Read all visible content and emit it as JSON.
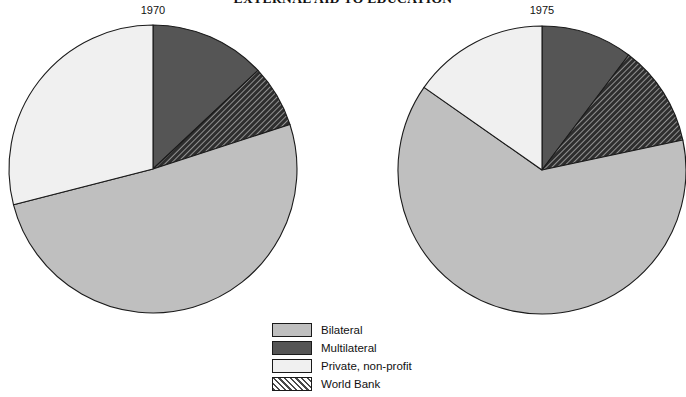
{
  "chart_data": {
    "type": "pie",
    "title": "EXTERNAL AID TO EDUCATION",
    "xlabel": "",
    "ylabel": "",
    "legend_position": "bottom-center",
    "grid": false,
    "categories": [
      "Bilateral",
      "Multilateral",
      "Private, non-profit",
      "World Bank"
    ],
    "charts": [
      {
        "label": "1970",
        "center": [
          153,
          169
        ],
        "radius": 144,
        "slices": [
          {
            "name": "Multilateral",
            "value": 13.0,
            "start_deg": 0,
            "end_deg": 46.8,
            "fill": "#555555",
            "pattern": "solid"
          },
          {
            "name": "World Bank",
            "value": 7.0,
            "start_deg": 46.8,
            "end_deg": 72.0,
            "fill": "#3a3a3a",
            "pattern": "hatch"
          },
          {
            "name": "Bilateral",
            "value": 51.0,
            "start_deg": 72.0,
            "end_deg": 255.6,
            "fill": "#bfbfbf",
            "pattern": "solid"
          },
          {
            "name": "Private, non-profit",
            "value": 29.0,
            "start_deg": 255.6,
            "end_deg": 360,
            "fill": "#f0f0f0",
            "pattern": "solid"
          }
        ]
      },
      {
        "label": "1975",
        "center": [
          542,
          170
        ],
        "radius": 144,
        "slices": [
          {
            "name": "Multilateral",
            "value": 10.3,
            "start_deg": 0,
            "end_deg": 37.0,
            "fill": "#555555",
            "pattern": "solid"
          },
          {
            "name": "World Bank",
            "value": 11.4,
            "start_deg": 37.0,
            "end_deg": 78.0,
            "fill": "#3a3a3a",
            "pattern": "hatch"
          },
          {
            "name": "Bilateral",
            "value": 63.1,
            "start_deg": 78.0,
            "end_deg": 305.0,
            "fill": "#bfbfbf",
            "pattern": "solid"
          },
          {
            "name": "Private, non-profit",
            "value": 15.2,
            "start_deg": 305.0,
            "end_deg": 360,
            "fill": "#f0f0f0",
            "pattern": "solid"
          }
        ]
      }
    ],
    "legend": [
      {
        "label": "Bilateral",
        "fill": "#bfbfbf",
        "pattern": "solid"
      },
      {
        "label": "Multilateral",
        "fill": "#555555",
        "pattern": "solid"
      },
      {
        "label": "Private, non-profit",
        "fill": "#f0f0f0",
        "pattern": "solid"
      },
      {
        "label": "World Bank",
        "fill": "#9a9a9a",
        "pattern": "hatch"
      }
    ],
    "colors": {
      "bilateral": "#bfbfbf",
      "multilateral": "#555555",
      "private_non_profit": "#f0f0f0",
      "world_bank": "#3a3a3a",
      "outline": "#1a1a1a",
      "background": "#ffffff"
    }
  }
}
